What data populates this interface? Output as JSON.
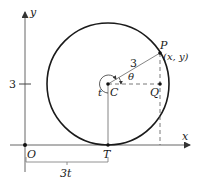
{
  "diagram": {
    "type": "geometry-figure",
    "axes": {
      "x_label": "x",
      "y_label": "y",
      "origin_label": "O",
      "y_tick_label": "3"
    },
    "points": {
      "center": "C",
      "point_on_circle": "P",
      "point_coords": "(x, y)",
      "foot": "Q",
      "tangent_point": "T"
    },
    "labels": {
      "radius": "3",
      "angle_theta": "θ",
      "angle_t": "t",
      "distance": "3t"
    },
    "colors": {
      "line": "#1a1a1a",
      "axis": "#555555"
    }
  }
}
